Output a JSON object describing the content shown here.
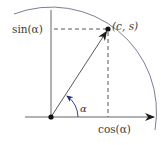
{
  "diagram": {
    "labels": {
      "sin": "sin(α)",
      "cos": "cos(α)",
      "point": "(c, s)",
      "angle": "α"
    },
    "colors": {
      "line": "#555555",
      "circle": "#6a6f88",
      "arrow": "#1a1a1a",
      "angle_arrow": "#1f2e7a",
      "text": "#3a3a3a"
    },
    "geometry": {
      "origin": [
        51,
        117
      ],
      "point": [
        108,
        29
      ],
      "radius": 105
    }
  }
}
